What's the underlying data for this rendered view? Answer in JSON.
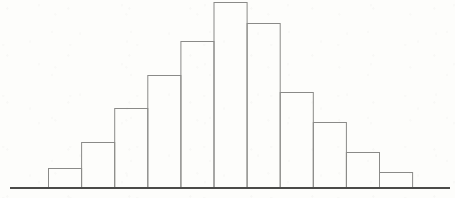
{
  "figure": {
    "width": 455,
    "height": 198,
    "background_color": "#fdfdfb",
    "bar_stroke_color": "#8a8a88",
    "bar_fill_color": "#ffffff",
    "axis_color": "#4a4a48"
  },
  "chart_data": {
    "type": "bar",
    "title": "",
    "subtitle": "",
    "xlabel": "",
    "ylabel": "",
    "grid": false,
    "legend": null,
    "categories": [
      "1",
      "2",
      "3",
      "4",
      "5",
      "6",
      "7",
      "8",
      "9",
      "10",
      "11"
    ],
    "tick_labels": [],
    "values": [
      20,
      46,
      80,
      113,
      147,
      186,
      165,
      96,
      66,
      36,
      16
    ],
    "ylim": [
      0,
      196
    ],
    "xlim": [
      0,
      11
    ],
    "annotations": [],
    "series": [
      {
        "name": "frequency",
        "values": [
          20,
          46,
          80,
          113,
          147,
          186,
          165,
          96,
          66,
          36,
          16
        ]
      }
    ]
  },
  "geometry": {
    "baseline_y": 188,
    "baseline_x_start": 10,
    "baseline_x_end": 450,
    "bar_left_x": 48,
    "bar_width": 33.1,
    "bar_tops_y": [
      168,
      142,
      108,
      75,
      41,
      2,
      23,
      92,
      122,
      152,
      172
    ]
  }
}
